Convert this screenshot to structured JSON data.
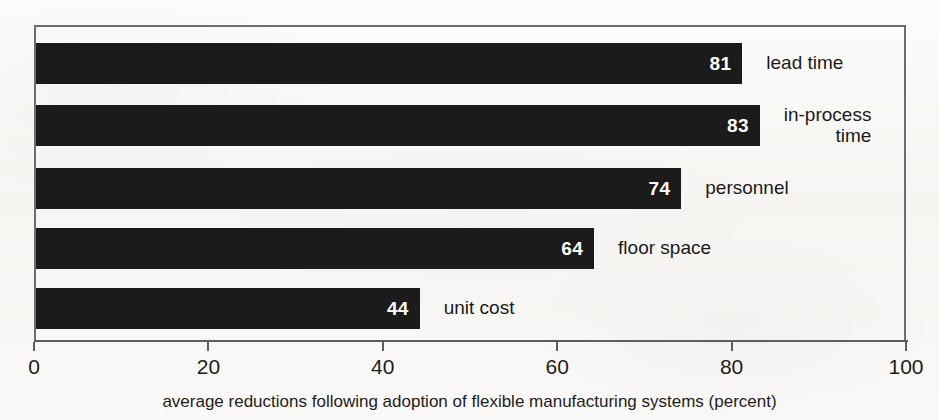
{
  "chart_data": {
    "type": "bar",
    "orientation": "horizontal",
    "title": "",
    "subtitle": "",
    "categories": [
      "lead time",
      "in-process time",
      "personnel",
      "floor space",
      "unit cost"
    ],
    "values": [
      81,
      83,
      74,
      64,
      44
    ],
    "value_labels": [
      "81",
      "83",
      "74",
      "64",
      "44"
    ],
    "xlabel": "average reductions following adoption of flexible manufacturing systems (percent)",
    "ylabel": "",
    "xlim": [
      0,
      100
    ],
    "xticks": [
      0,
      20,
      40,
      60,
      80,
      100
    ],
    "xtick_labels": [
      "0",
      "20",
      "40",
      "60",
      "80",
      "100"
    ],
    "grid": false,
    "legend": false,
    "bar_color": "#1b1b1b",
    "value_label_color": "#ffffff",
    "background_color": "#fbfaf8",
    "axis_color": "#5d5d5d",
    "bars": [
      {
        "label": "lead time",
        "label_lines": [
          "lead time"
        ],
        "value": 81,
        "value_text": "81"
      },
      {
        "label": "in-process time",
        "label_lines": [
          "in-process",
          "time"
        ],
        "value": 83,
        "value_text": "83"
      },
      {
        "label": "personnel",
        "label_lines": [
          "personnel"
        ],
        "value": 74,
        "value_text": "74"
      },
      {
        "label": "floor space",
        "label_lines": [
          "floor space"
        ],
        "value": 64,
        "value_text": "64"
      },
      {
        "label": "unit cost",
        "label_lines": [
          "unit cost"
        ],
        "value": 44,
        "value_text": "44"
      }
    ]
  },
  "caption": {
    "text": "average reductions following adoption of flexible manufacturing systems (percent)"
  },
  "axis": {
    "ticks": [
      {
        "value": 0,
        "label": "0"
      },
      {
        "value": 20,
        "label": "20"
      },
      {
        "value": 40,
        "label": "40"
      },
      {
        "value": 60,
        "label": "60"
      },
      {
        "value": 80,
        "label": "80"
      },
      {
        "value": 100,
        "label": "100"
      }
    ]
  },
  "geometry": {
    "plot_left_px": 34,
    "plot_right_px": 906,
    "plot_top_px": 25,
    "axis_y_px": 340,
    "bar_height_px": 41,
    "bar_tops_px": [
      43,
      105,
      168,
      228,
      288
    ]
  }
}
